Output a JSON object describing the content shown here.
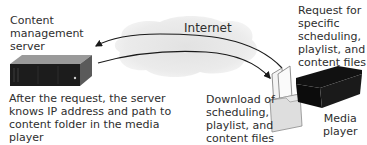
{
  "diagram": {
    "nodes": {
      "server": {
        "label": "Content\nmanagement\nserver",
        "icon": "server-rack-icon"
      },
      "internet": {
        "label": "Internet",
        "icon": "cloud-icon"
      },
      "player": {
        "label": "Media\nplayer",
        "icon": "media-player-box-icon"
      },
      "files": {
        "icon": "folder-files-icon"
      }
    },
    "edges": {
      "request": {
        "label": "Request for\nspecific\nscheduling,\nplaylist, and\ncontent files",
        "from": "player",
        "to": "server"
      },
      "download": {
        "label": "Download of\nscheduling,\nplaylist, and\ncontent files",
        "from": "server",
        "to": "player"
      }
    },
    "notes": {
      "server_note": "After the request, the server\nknows IP address and path to\ncontent folder in the media\nplayer"
    },
    "colors": {
      "cloud": "#e4e4e4",
      "device": "#161616",
      "arrow": "#1a1a1a",
      "folder": "#e0e0e0"
    }
  }
}
